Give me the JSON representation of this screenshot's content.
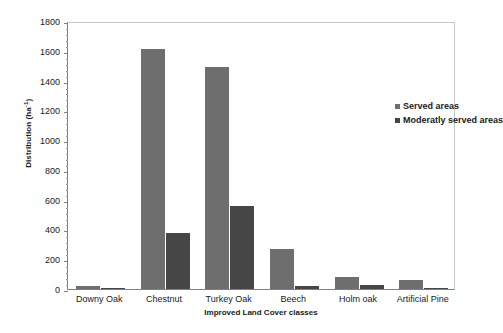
{
  "chart_data": {
    "type": "bar",
    "title": "",
    "xlabel": "Improved Land Cover classes",
    "ylabel": "Distribution  (ha",
    "ylabel_sup": "-1",
    "ylabel_suffix": ")",
    "categories": [
      "Downy Oak",
      "Chestnut",
      "Turkey Oak",
      "Beech",
      "Holm oak",
      "Artificial Pine"
    ],
    "series": [
      {
        "name": "Served areas",
        "color": "#6e6e6e",
        "values": [
          22,
          1612,
          1490,
          270,
          78,
          58
        ]
      },
      {
        "name": "Moderatly served areas",
        "color": "#464646",
        "values": [
          5,
          375,
          558,
          20,
          30,
          5
        ]
      }
    ],
    "ylim": [
      0,
      1800
    ],
    "ytick_step": 200,
    "yticks": [
      0,
      200,
      400,
      600,
      800,
      1000,
      1200,
      1400,
      1600,
      1800
    ],
    "ytick_labels": [
      "0",
      "200",
      "400",
      "600",
      "800",
      "1000",
      "1200",
      "1400",
      "1600",
      "1800"
    ],
    "minor_ticks_per_major": 4,
    "grid": false,
    "legend_position": "upper-right-inside",
    "background": "#ffffff",
    "axis_color": "#808080"
  },
  "legend": {
    "items": [
      {
        "label": "Served areas",
        "color": "#6e6e6e"
      },
      {
        "label": "Moderatly served areas",
        "color": "#464646"
      }
    ]
  }
}
